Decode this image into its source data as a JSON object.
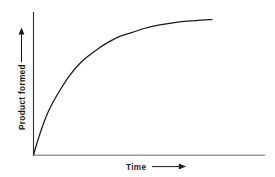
{
  "figure": {
    "background_color": "#ffffff",
    "width": 275,
    "height": 177
  },
  "chart_data": {
    "type": "line",
    "title": "",
    "subtitle": "",
    "xlabel": "Time",
    "ylabel": "Product formed",
    "xlabel_arrow": "right-arrow",
    "ylabel_arrow": "up-arrow",
    "grid": false,
    "legend": null,
    "xticks": [],
    "yticks": [],
    "xtick_labels": [],
    "ytick_labels": [],
    "xlim": [
      0,
      1
    ],
    "ylim": [
      0,
      1
    ],
    "annotations": [],
    "line_color": "#1a1a1a",
    "axis_color": "#9a9a9a",
    "series": [
      {
        "name": "Product formed vs Time",
        "description": "Saturating exponential approach to plateau (enzyme reaction progress curve)",
        "x": [
          0.0,
          0.02,
          0.05,
          0.08,
          0.11,
          0.15,
          0.2,
          0.25,
          0.3,
          0.36,
          0.42,
          0.48,
          0.55,
          0.62,
          0.7,
          0.78,
          0.86,
          0.93,
          1.0
        ],
        "y": [
          0.0,
          0.09,
          0.21,
          0.31,
          0.39,
          0.48,
          0.58,
          0.66,
          0.72,
          0.78,
          0.83,
          0.87,
          0.9,
          0.93,
          0.955,
          0.972,
          0.984,
          0.991,
          0.996
        ]
      }
    ]
  },
  "axes": {
    "y_axis_name": "y-axis-line",
    "x_axis_name": "x-axis-line"
  }
}
